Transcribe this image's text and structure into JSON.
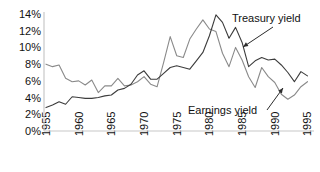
{
  "chart_data": {
    "type": "line",
    "title": "",
    "subtitle": "",
    "xlabel": "",
    "ylabel": "",
    "xlim": [
      1955,
      1996
    ],
    "ylim": [
      0,
      14
    ],
    "grid": false,
    "legend_position": "inline-annotations",
    "y_ticks": [
      "0%",
      "2%",
      "4%",
      "6%",
      "8%",
      "10%",
      "12%",
      "14%"
    ],
    "y_tick_values": [
      0,
      2,
      4,
      6,
      8,
      10,
      12,
      14
    ],
    "x_ticks": [
      "1955",
      "1960",
      "1965",
      "1970",
      "1975",
      "1980",
      "1985",
      "1990",
      "1995"
    ],
    "x_tick_values": [
      1955,
      1960,
      1965,
      1970,
      1975,
      1980,
      1985,
      1990,
      1995
    ],
    "x": [
      1955,
      1956,
      1957,
      1958,
      1959,
      1960,
      1961,
      1962,
      1963,
      1964,
      1965,
      1966,
      1967,
      1968,
      1969,
      1970,
      1971,
      1972,
      1973,
      1974,
      1975,
      1976,
      1977,
      1978,
      1979,
      1980,
      1981,
      1982,
      1983,
      1984,
      1985,
      1986,
      1987,
      1988,
      1989,
      1990,
      1991,
      1992,
      1993,
      1994,
      1995
    ],
    "series": [
      {
        "name": "Earnings yield",
        "color": "#8a8a8a",
        "values": [
          8.0,
          7.7,
          7.9,
          6.3,
          5.9,
          6.0,
          5.5,
          6.1,
          4.6,
          5.4,
          5.4,
          6.3,
          5.4,
          5.5,
          5.9,
          6.5,
          5.6,
          5.3,
          8.2,
          11.3,
          9.0,
          8.8,
          11.0,
          12.2,
          13.3,
          12.2,
          11.9,
          9.3,
          7.7,
          10.0,
          8.5,
          6.5,
          5.2,
          7.6,
          6.5,
          5.8,
          4.4,
          3.8,
          4.3,
          5.3,
          5.9
        ]
      },
      {
        "name": "Treasury yield",
        "color": "#3c3c3c",
        "values": [
          2.8,
          3.1,
          3.5,
          3.2,
          4.1,
          4.0,
          3.9,
          3.9,
          4.0,
          4.2,
          4.3,
          4.9,
          5.1,
          5.6,
          6.7,
          7.2,
          6.2,
          6.2,
          6.9,
          7.6,
          7.8,
          7.6,
          7.4,
          8.4,
          9.4,
          11.4,
          13.9,
          13.0,
          11.1,
          12.4,
          10.6,
          7.7,
          8.4,
          8.8,
          8.5,
          8.6,
          7.9,
          7.0,
          5.9,
          7.1,
          6.6
        ]
      }
    ],
    "annotations": [
      {
        "name": "treasury-yield-annotation",
        "label": "Treasury yield",
        "text_x": 232,
        "text_y": 22,
        "leader_from_x": 273,
        "leader_from_y": 27,
        "leader_to_x": 243,
        "leader_to_y": 47
      },
      {
        "name": "earnings-yield-annotation",
        "label": "Earnings yield",
        "text_x": 188,
        "text_y": 114,
        "leader_from_x": 267,
        "leader_from_y": 110,
        "leader_to_x": 283,
        "leader_to_y": 88
      }
    ]
  },
  "axis": {
    "baseline_color": "#c8c8c8",
    "background": "#ffffff"
  }
}
